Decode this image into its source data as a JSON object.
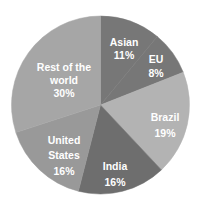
{
  "chart_data": {
    "type": "pie",
    "title": "",
    "categories": [
      "Asian",
      "EU",
      "Brazil",
      "India",
      "United States",
      "Rest of the world"
    ],
    "values": [
      11,
      8,
      19,
      16,
      16,
      30
    ],
    "unit": "%",
    "start_angle_deg": 0,
    "direction": "clockwise",
    "legend": "none (labels inside slices)",
    "slices": [
      {
        "name": "Asian",
        "value": 11,
        "label_lines": [
          "Asian",
          "11%"
        ],
        "color": "#777777"
      },
      {
        "name": "EU",
        "value": 8,
        "label_lines": [
          "EU",
          "8%"
        ],
        "color": "#777777"
      },
      {
        "name": "Brazil",
        "value": 19,
        "label_lines": [
          "Brazil",
          "19%"
        ],
        "color": "#b3b3b3"
      },
      {
        "name": "India",
        "value": 16,
        "label_lines": [
          "India",
          "16%"
        ],
        "color": "#6e6e6e"
      },
      {
        "name": "United States",
        "value": 16,
        "label_lines": [
          "United",
          "States",
          "16%"
        ],
        "color": "#999999"
      },
      {
        "name": "Rest of the world",
        "value": 30,
        "label_lines": [
          "Rest of the",
          "world",
          "30%"
        ],
        "color": "#a6a6a6"
      }
    ]
  },
  "labels": {
    "asian": {
      "name": "Asian",
      "pct": "11%"
    },
    "eu": {
      "name": "EU",
      "pct": "8%"
    },
    "brazil": {
      "name": "Brazil",
      "pct": "19%"
    },
    "india": {
      "name": "India",
      "pct": "16%"
    },
    "us": {
      "line1": "United",
      "line2": "States",
      "pct": "16%"
    },
    "rest": {
      "line1": "Rest of the",
      "line2": "world",
      "pct": "30%"
    }
  }
}
